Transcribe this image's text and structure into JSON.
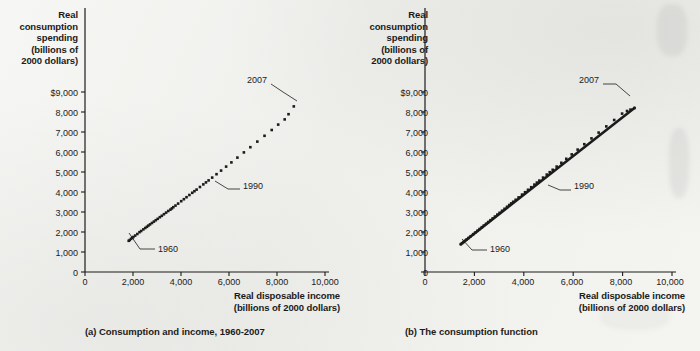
{
  "figure": {
    "background_color": "#f2f2f0",
    "ink_color": "#1b1b1b"
  },
  "panels": [
    {
      "id": "a",
      "caption": "(a) Consumption and income, 1960-2007",
      "y_axis_title_lines": [
        "Real",
        "consumption",
        "spending",
        "(billions of",
        "2000 dollars)"
      ],
      "x_axis_title_lines": [
        "Real disposable income",
        "(billions of 2000 dollars)"
      ],
      "y_ticks": [
        "0",
        "1,000",
        "2,000",
        "3,000",
        "4,000",
        "5,000",
        "6,000",
        "7,000",
        "8,000",
        "$9,000"
      ],
      "x_ticks": [
        "0",
        "2,000",
        "4,000",
        "6,000",
        "8,000",
        "10,000"
      ],
      "annotations": [
        {
          "name": "annotation-1960",
          "text": "1960"
        },
        {
          "name": "annotation-1990",
          "text": "1990"
        },
        {
          "name": "annotation-2007",
          "text": "2007"
        }
      ]
    },
    {
      "id": "b",
      "caption": "(b)  The consumption function",
      "y_axis_title_lines": [
        "Real",
        "consumption",
        "spending",
        "(billions of",
        "2000 dollars)"
      ],
      "x_axis_title_lines": [
        "Real disposable income",
        "(billions of 2000 dollars)"
      ],
      "y_ticks": [
        "0",
        "1,000",
        "2,000",
        "3,000",
        "4,000",
        "5,000",
        "6,000",
        "7,000",
        "8,000",
        "$9,000"
      ],
      "x_ticks": [
        "0",
        "2,000",
        "4,000",
        "6,000",
        "8,000",
        "10,000"
      ],
      "annotations": [
        {
          "name": "annotation-1960",
          "text": "1960"
        },
        {
          "name": "annotation-1990",
          "text": "1990"
        },
        {
          "name": "annotation-2007",
          "text": "2007"
        }
      ]
    }
  ],
  "chart_data": [
    {
      "type": "scatter",
      "title": "(a) Consumption and income, 1960-2007",
      "xlabel": "Real disposable income (billions of 2000 dollars)",
      "ylabel": "Real consumption spending (billions of 2000 dollars)",
      "xlim": [
        0,
        10000
      ],
      "ylim": [
        0,
        9000
      ],
      "xticks": [
        0,
        2000,
        4000,
        6000,
        8000,
        10000
      ],
      "yticks": [
        0,
        1000,
        2000,
        3000,
        4000,
        5000,
        6000,
        7000,
        8000,
        9000
      ],
      "grid": false,
      "legend": "none",
      "marker": "filled-square",
      "series": [
        {
          "name": "Consumption vs disposable income, 1960-2007",
          "x": [
            1821,
            1865,
            1920,
            1970,
            2015,
            2090,
            2180,
            2270,
            2340,
            2430,
            2510,
            2580,
            2640,
            2710,
            2790,
            2870,
            2950,
            3030,
            3120,
            3200,
            3290,
            3380,
            3470,
            3560,
            3620,
            3680,
            3770,
            3880,
            4010,
            4120,
            4230,
            4350,
            4470,
            4560,
            4650,
            4790,
            4930,
            5040,
            5150,
            5300,
            5480,
            5670,
            5880,
            6100,
            6350,
            6620,
            6890,
            7180,
            7480,
            7780,
            8050,
            8320,
            8480,
            8700
          ],
          "y": [
            1560,
            1600,
            1660,
            1710,
            1750,
            1820,
            1900,
            1990,
            2050,
            2130,
            2200,
            2260,
            2320,
            2380,
            2450,
            2520,
            2590,
            2660,
            2740,
            2810,
            2890,
            2970,
            3050,
            3120,
            3180,
            3240,
            3320,
            3420,
            3540,
            3640,
            3740,
            3850,
            3960,
            4040,
            4120,
            4250,
            4380,
            4480,
            4580,
            4720,
            4890,
            5070,
            5270,
            5480,
            5720,
            5980,
            6240,
            6520,
            6810,
            7100,
            7370,
            7630,
            7890,
            8280
          ]
        }
      ],
      "annotations": [
        {
          "label": "1960",
          "x": 1821,
          "y": 1560
        },
        {
          "label": "1990",
          "x": 5040,
          "y": 4480
        },
        {
          "label": "2007",
          "x": 8700,
          "y": 8280
        }
      ]
    },
    {
      "type": "scatter",
      "title": "(b)  The consumption function",
      "xlabel": "Real disposable income (billions of 2000 dollars)",
      "ylabel": "Real consumption spending (billions of 2000 dollars)",
      "xlim": [
        0,
        10000
      ],
      "ylim": [
        0,
        9000
      ],
      "xticks": [
        0,
        2000,
        4000,
        6000,
        8000,
        10000
      ],
      "yticks": [
        0,
        1000,
        2000,
        3000,
        4000,
        5000,
        6000,
        7000,
        8000,
        9000
      ],
      "grid": false,
      "legend": "none",
      "marker": "filled-square",
      "trendline": {
        "name": "consumption function",
        "x": [
          1450,
          8480
        ],
        "y": [
          1390,
          8200
        ]
      },
      "series": [
        {
          "name": "Consumption vs disposable income with fitted consumption function",
          "x": [
            1450,
            1500,
            1560,
            1620,
            1680,
            1760,
            1850,
            1950,
            2030,
            2120,
            2210,
            2300,
            2380,
            2470,
            2560,
            2650,
            2740,
            2830,
            2930,
            3020,
            3120,
            3220,
            3320,
            3410,
            3490,
            3570,
            3670,
            3790,
            3930,
            4050,
            4170,
            4300,
            4430,
            4530,
            4630,
            4780,
            4930,
            5050,
            5170,
            5330,
            5520,
            5720,
            5940,
            6180,
            6450,
            6740,
            7030,
            7340,
            7660,
            7980,
            8180,
            8320,
            8480
          ],
          "y": [
            1390,
            1440,
            1500,
            1560,
            1620,
            1700,
            1790,
            1890,
            1970,
            2060,
            2150,
            2240,
            2320,
            2410,
            2500,
            2590,
            2680,
            2770,
            2870,
            2960,
            3060,
            3160,
            3260,
            3350,
            3430,
            3510,
            3610,
            3730,
            3870,
            3990,
            4110,
            4240,
            4370,
            4470,
            4570,
            4720,
            4870,
            4990,
            5110,
            5270,
            5460,
            5660,
            5880,
            6120,
            6390,
            6680,
            6970,
            7280,
            7600,
            7920,
            8050,
            8120,
            8200
          ]
        }
      ],
      "annotations": [
        {
          "label": "1960",
          "x": 1450,
          "y": 1390
        },
        {
          "label": "1990",
          "x": 5050,
          "y": 4990
        },
        {
          "label": "2007",
          "x": 8480,
          "y": 8200
        }
      ]
    }
  ]
}
